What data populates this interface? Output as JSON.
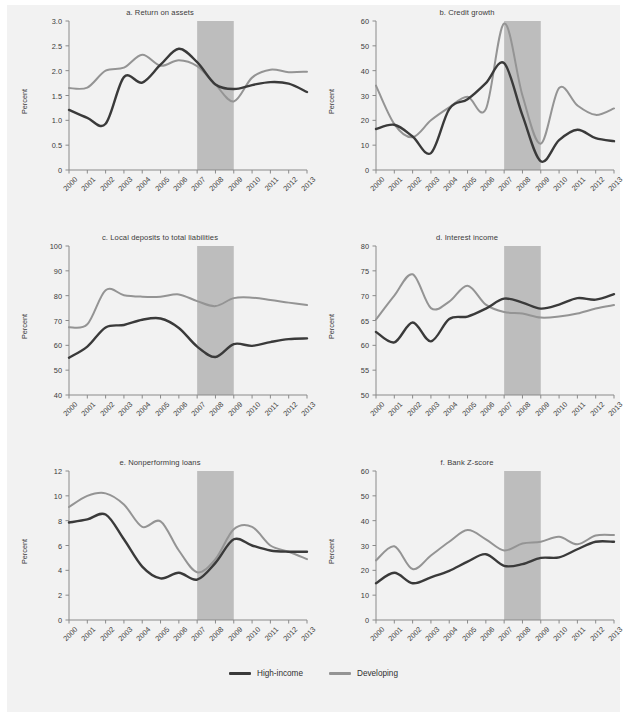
{
  "figure": {
    "background_color": "#f2f2f2",
    "band_color": "#bdbdbd",
    "axis_color": "#8a8a8a"
  },
  "legend": {
    "position": "bottom-center",
    "items": [
      {
        "label": "High-income",
        "color": "#3a3a3a"
      },
      {
        "label": "Developing",
        "color": "#949494"
      }
    ]
  },
  "chart_data": [
    {
      "type": "line",
      "panel": "a",
      "title": "a. Return on assets",
      "xlabel": "",
      "ylabel": "Percent",
      "x": [
        2000,
        2001,
        2002,
        2003,
        2004,
        2005,
        2006,
        2007,
        2008,
        2009,
        2010,
        2011,
        2012,
        2013
      ],
      "xlim": [
        2000,
        2013
      ],
      "ylim": [
        0,
        3.0
      ],
      "yticks": [
        0,
        0.5,
        1.0,
        1.5,
        2.0,
        2.5,
        3.0
      ],
      "yticklabels": [
        "0",
        "0.5",
        "1.0",
        "1.5",
        "2.0",
        "2.5",
        "3.0"
      ],
      "xticklabels": [
        "2000",
        "2001",
        "2002",
        "2003",
        "2004",
        "2005",
        "2006",
        "2007",
        "2008",
        "2009",
        "2010",
        "2011",
        "2012",
        "2013"
      ],
      "grid": false,
      "shaded_band": {
        "from": 2007,
        "to": 2009
      },
      "series": [
        {
          "name": "High-income",
          "color": "#3a3a3a",
          "values": [
            1.21,
            1.05,
            0.93,
            1.87,
            1.76,
            2.12,
            2.44,
            2.17,
            1.72,
            1.63,
            1.71,
            1.77,
            1.74,
            1.57
          ]
        },
        {
          "name": "Developing",
          "color": "#949494",
          "values": [
            1.65,
            1.66,
            2.0,
            2.06,
            2.32,
            2.1,
            2.21,
            2.09,
            1.72,
            1.38,
            1.86,
            2.02,
            1.97,
            1.98
          ]
        }
      ]
    },
    {
      "type": "line",
      "panel": "b",
      "title": "b. Credit growth",
      "xlabel": "",
      "ylabel": "Percent",
      "x": [
        2000,
        2001,
        2002,
        2003,
        2004,
        2005,
        2006,
        2007,
        2008,
        2009,
        2010,
        2011,
        2012,
        2013
      ],
      "xlim": [
        2000,
        2013
      ],
      "ylim": [
        0,
        60
      ],
      "yticks": [
        0,
        10,
        20,
        30,
        40,
        50,
        60
      ],
      "yticklabels": [
        "0",
        "10",
        "20",
        "30",
        "40",
        "50",
        "60"
      ],
      "xticklabels": [
        "2000",
        "2001",
        "2002",
        "2003",
        "2004",
        "2005",
        "2006",
        "2007",
        "2008",
        "2009",
        "2010",
        "2011",
        "2012",
        "2013"
      ],
      "grid": false,
      "shaded_band": {
        "from": 2007,
        "to": 2009
      },
      "series": [
        {
          "name": "High-income",
          "color": "#3a3a3a",
          "values": [
            16.5,
            18.2,
            13.5,
            6.8,
            24.5,
            28.5,
            35.0,
            43.0,
            22.0,
            3.5,
            12.0,
            16.2,
            12.8,
            11.6
          ]
        },
        {
          "name": "Developing",
          "color": "#949494",
          "values": [
            34.0,
            18.5,
            13.2,
            20.0,
            25.2,
            29.5,
            24.5,
            59.0,
            30.0,
            10.6,
            33.0,
            26.0,
            22.2,
            24.8
          ]
        }
      ]
    },
    {
      "type": "line",
      "panel": "c",
      "title": "c. Local deposits to total liabilities",
      "xlabel": "",
      "ylabel": "Percent",
      "x": [
        2000,
        2001,
        2002,
        2003,
        2004,
        2005,
        2006,
        2007,
        2008,
        2009,
        2010,
        2011,
        2012,
        2013
      ],
      "xlim": [
        2000,
        2013
      ],
      "ylim": [
        40,
        100
      ],
      "yticks": [
        40,
        50,
        60,
        70,
        80,
        90,
        100
      ],
      "yticklabels": [
        "40",
        "50",
        "60",
        "70",
        "80",
        "90",
        "100"
      ],
      "xticklabels": [
        "2000",
        "2001",
        "2002",
        "2003",
        "2004",
        "2005",
        "2006",
        "2007",
        "2008",
        "2009",
        "2010",
        "2011",
        "2012",
        "2013"
      ],
      "grid": false,
      "shaded_band": {
        "from": 2007,
        "to": 2009
      },
      "series": [
        {
          "name": "High-income",
          "color": "#3a3a3a",
          "values": [
            55.0,
            59.5,
            67.2,
            68.2,
            70.3,
            70.8,
            67.0,
            59.5,
            55.3,
            60.5,
            59.8,
            61.3,
            62.5,
            62.8
          ]
        },
        {
          "name": "Developing",
          "color": "#949494",
          "values": [
            67.3,
            68.5,
            82.2,
            80.2,
            79.6,
            79.6,
            80.5,
            77.8,
            75.8,
            79.0,
            79.2,
            78.3,
            77.2,
            76.2
          ]
        }
      ]
    },
    {
      "type": "line",
      "panel": "d",
      "title": "d. Interest income",
      "xlabel": "",
      "ylabel": "Percent",
      "x": [
        2000,
        2001,
        2002,
        2003,
        2004,
        2005,
        2006,
        2007,
        2008,
        2009,
        2010,
        2011,
        2012,
        2013
      ],
      "xlim": [
        2000,
        2013
      ],
      "ylim": [
        50,
        80
      ],
      "yticks": [
        50,
        55,
        60,
        65,
        70,
        75,
        80
      ],
      "yticklabels": [
        "50",
        "55",
        "60",
        "65",
        "70",
        "75",
        "80"
      ],
      "xticklabels": [
        "2000",
        "2001",
        "2002",
        "2003",
        "2004",
        "2005",
        "2006",
        "2007",
        "2008",
        "2009",
        "2010",
        "2011",
        "2012",
        "2013"
      ],
      "grid": false,
      "shaded_band": {
        "from": 2007,
        "to": 2009
      },
      "series": [
        {
          "name": "High-income",
          "color": "#3a3a3a",
          "values": [
            62.7,
            60.6,
            64.6,
            60.8,
            65.3,
            65.8,
            67.4,
            69.4,
            68.6,
            67.4,
            68.2,
            69.5,
            69.2,
            70.3
          ]
        },
        {
          "name": "Developing",
          "color": "#949494",
          "values": [
            65.2,
            70.0,
            74.3,
            67.5,
            68.8,
            72.0,
            68.2,
            66.7,
            66.4,
            65.6,
            65.8,
            66.4,
            67.4,
            68.1
          ]
        }
      ]
    },
    {
      "type": "line",
      "panel": "e",
      "title": "e. Nonperforming loans",
      "xlabel": "",
      "ylabel": "Percent",
      "x": [
        2000,
        2001,
        2002,
        2003,
        2004,
        2005,
        2006,
        2007,
        2008,
        2009,
        2010,
        2011,
        2012,
        2013
      ],
      "xlim": [
        2000,
        2013
      ],
      "ylim": [
        0,
        12
      ],
      "yticks": [
        0,
        2,
        4,
        6,
        8,
        10,
        12
      ],
      "yticklabels": [
        "0",
        "2",
        "4",
        "6",
        "8",
        "10",
        "12"
      ],
      "xticklabels": [
        "2000",
        "2001",
        "2002",
        "2003",
        "2004",
        "2005",
        "2006",
        "2007",
        "2008",
        "2009",
        "2010",
        "2011",
        "2012",
        "2013"
      ],
      "grid": false,
      "shaded_band": {
        "from": 2007,
        "to": 2009
      },
      "series": [
        {
          "name": "High-income",
          "color": "#3a3a3a",
          "values": [
            7.85,
            8.1,
            8.5,
            6.5,
            4.3,
            3.35,
            3.8,
            3.25,
            4.6,
            6.5,
            6.0,
            5.6,
            5.5,
            5.5
          ]
        },
        {
          "name": "Developing",
          "color": "#949494",
          "values": [
            9.1,
            10.0,
            10.2,
            9.3,
            7.5,
            7.95,
            5.6,
            3.85,
            4.9,
            7.3,
            7.5,
            6.0,
            5.5,
            4.9
          ]
        }
      ]
    },
    {
      "type": "line",
      "panel": "f",
      "title": "f. Bank Z-score",
      "xlabel": "",
      "ylabel": "Percent",
      "x": [
        2000,
        2001,
        2002,
        2003,
        2004,
        2005,
        2006,
        2007,
        2008,
        2009,
        2010,
        2011,
        2012,
        2013
      ],
      "xlim": [
        2000,
        2013
      ],
      "ylim": [
        0,
        60
      ],
      "yticks": [
        0,
        10,
        20,
        30,
        40,
        50,
        60
      ],
      "yticklabels": [
        "0",
        "10",
        "20",
        "30",
        "40",
        "50",
        "60"
      ],
      "xticklabels": [
        "2000",
        "2001",
        "2002",
        "2003",
        "2004",
        "2005",
        "2006",
        "2007",
        "2008",
        "2009",
        "2010",
        "2011",
        "2012",
        "2013"
      ],
      "grid": false,
      "shaded_band": {
        "from": 2007,
        "to": 2009
      },
      "series": [
        {
          "name": "High-income",
          "color": "#3a3a3a",
          "values": [
            14.8,
            19.0,
            14.8,
            17.2,
            19.8,
            23.5,
            26.5,
            21.8,
            22.5,
            25.0,
            25.2,
            28.5,
            31.5,
            31.5
          ]
        },
        {
          "name": "Developing",
          "color": "#949494",
          "values": [
            24.0,
            29.7,
            20.5,
            26.0,
            31.5,
            36.2,
            32.5,
            28.0,
            30.8,
            31.5,
            33.5,
            30.5,
            34.0,
            34.2
          ]
        }
      ]
    }
  ]
}
